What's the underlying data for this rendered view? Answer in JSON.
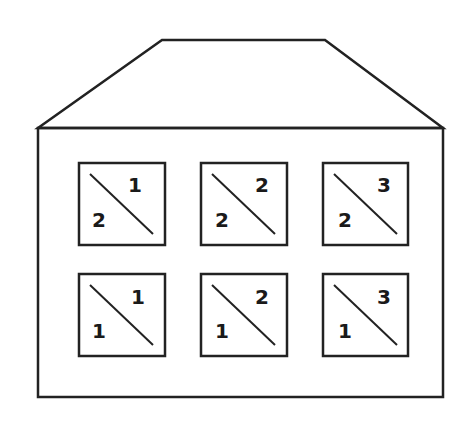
{
  "diagram": {
    "colors": {
      "stroke": "#222222",
      "background": "#ffffff",
      "text": "#1a1a1a"
    },
    "roof": {
      "top_left": [
        162,
        40
      ],
      "top_right": [
        325,
        40
      ],
      "bottom_left": [
        38,
        128
      ],
      "bottom_right": [
        443,
        128
      ]
    },
    "body": {
      "x": 38,
      "y": 128,
      "width": 405,
      "height": 269
    },
    "rows": [
      {
        "row": "top",
        "cells": [
          {
            "top_right": "1",
            "bottom_left": "2"
          },
          {
            "top_right": "2",
            "bottom_left": "2"
          },
          {
            "top_right": "3",
            "bottom_left": "2"
          }
        ]
      },
      {
        "row": "bottom",
        "cells": [
          {
            "top_right": "1",
            "bottom_left": "1"
          },
          {
            "top_right": "2",
            "bottom_left": "1"
          },
          {
            "top_right": "3",
            "bottom_left": "1"
          }
        ]
      }
    ]
  }
}
